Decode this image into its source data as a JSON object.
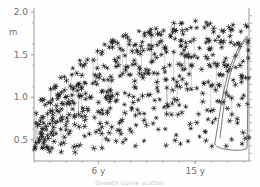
{
  "figure": {
    "title": "",
    "unit_label": "m",
    "caption": "Growth curve scatter"
  },
  "chart_data": {
    "type": "scatter",
    "title": "",
    "xlabel": "",
    "ylabel": "m",
    "ylim": [
      0.25,
      2.05
    ],
    "xlim": [
      0,
      20
    ],
    "grid": false,
    "legend": null,
    "y_ticks": [
      {
        "label": "2.0",
        "value": 2.0
      },
      {
        "label": "1.5",
        "value": 1.5
      },
      {
        "label": "1.0",
        "value": 1.0
      },
      {
        "label": "0.5",
        "value": 0.5
      }
    ],
    "x_ticks": [
      {
        "label": "6 y",
        "value": 6
      },
      {
        "label": "15 y",
        "value": 15
      }
    ],
    "marker_style": "asterisk",
    "point_count": 520,
    "series": [
      {
        "name": "measurements",
        "x": [
          0.6,
          1.0,
          1.4,
          1.8,
          2.2,
          2.6,
          3.0,
          3.4,
          3.8,
          4.2,
          4.6,
          5.0,
          5.4,
          5.8,
          6.2,
          6.6,
          7.0,
          7.4,
          7.8,
          8.2,
          8.6,
          9.0,
          9.4,
          9.8,
          10.2,
          10.6,
          11.0,
          11.4,
          11.8,
          12.2,
          12.6,
          13.0,
          13.4,
          13.8,
          14.2,
          14.6,
          15.0,
          15.4,
          15.8,
          16.2,
          16.6,
          17.0,
          17.4,
          17.8,
          18.2,
          18.6,
          19.0,
          19.4
        ],
        "y": [
          0.52,
          0.6,
          0.66,
          0.72,
          0.8,
          0.86,
          0.93,
          0.99,
          1.05,
          1.1,
          1.16,
          1.21,
          1.26,
          1.31,
          1.35,
          1.4,
          1.44,
          1.48,
          1.52,
          1.55,
          1.58,
          1.61,
          1.64,
          1.66,
          1.69,
          1.71,
          1.73,
          1.75,
          1.76,
          1.78,
          1.79,
          1.8,
          1.81,
          1.82,
          1.82,
          1.83,
          1.83,
          1.83,
          1.83,
          1.82,
          1.82,
          1.81,
          1.81,
          1.8,
          1.8,
          1.79,
          1.79,
          1.78
        ]
      }
    ],
    "envelope_upper": [
      {
        "x": 0.5,
        "y": 0.95
      },
      {
        "x": 3,
        "y": 1.32
      },
      {
        "x": 6,
        "y": 1.6
      },
      {
        "x": 9,
        "y": 1.76
      },
      {
        "x": 12,
        "y": 1.86
      },
      {
        "x": 15,
        "y": 1.9
      },
      {
        "x": 18,
        "y": 1.88
      },
      {
        "x": 19.5,
        "y": 1.85
      }
    ],
    "envelope_lower": [
      {
        "x": 0.5,
        "y": 0.3
      },
      {
        "x": 3,
        "y": 0.33
      },
      {
        "x": 6,
        "y": 0.36
      },
      {
        "x": 9,
        "y": 0.38
      },
      {
        "x": 12,
        "y": 0.4
      },
      {
        "x": 15,
        "y": 0.4
      },
      {
        "x": 18,
        "y": 0.38
      },
      {
        "x": 19.5,
        "y": 0.35
      }
    ],
    "marginal_density": {
      "position": "right",
      "peak_y": 1.72,
      "description": "narrow vertical density loop hugging the right axis"
    }
  },
  "colors": {
    "marker": "#262626",
    "axis": "#9a9a9a",
    "tick_label": "#6e6e6e",
    "connector": "#808080",
    "background": "#fefefe"
  }
}
